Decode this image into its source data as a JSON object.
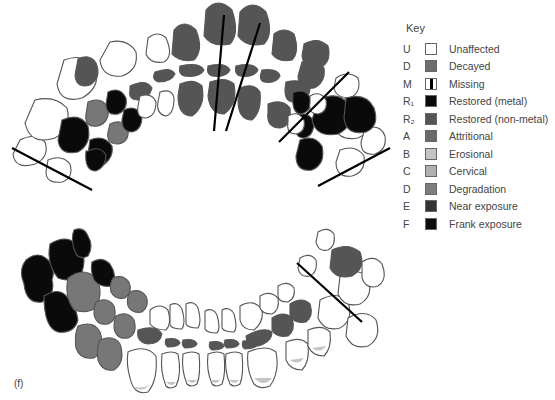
{
  "figure": {
    "panel_label": "(f)"
  },
  "key": {
    "title": "Key",
    "items": [
      {
        "code": "U",
        "label": "Unaffected",
        "color": "#ffffff",
        "style": "plain"
      },
      {
        "code": "D",
        "label": "Decayed",
        "color": "#6e6e6e",
        "style": "plain"
      },
      {
        "code": "M",
        "label": "Missing",
        "color": "#ffffff",
        "style": "missing"
      },
      {
        "code": "R₁",
        "label": "Restored (metal)",
        "color": "#0a0a0a",
        "style": "plain"
      },
      {
        "code": "R₂",
        "label": "Restored (non-metal)",
        "color": "#555555",
        "style": "plain"
      },
      {
        "code": "A",
        "label": "Attritional",
        "color": "#6a6a6a",
        "style": "plain"
      },
      {
        "code": "B",
        "label": "Erosional",
        "color": "#c4c4c4",
        "style": "plain"
      },
      {
        "code": "C",
        "label": "Cervical",
        "color": "#b0b0b0",
        "style": "plain"
      },
      {
        "code": "D",
        "label": "Degradation",
        "color": "#7d7d7d",
        "style": "plain"
      },
      {
        "code": "E",
        "label": "Near exposure",
        "color": "#333333",
        "style": "plain"
      },
      {
        "code": "F",
        "label": "Frank exposure",
        "color": "#0d0d0d",
        "style": "plain"
      }
    ]
  },
  "colors": {
    "outline": "#555555",
    "unaffected": "#ffffff",
    "decayed": "#555555",
    "metal": "#0a0a0a",
    "degradation": "#7d7d7d",
    "erosional": "#c4c4c4",
    "line": "#000000"
  }
}
